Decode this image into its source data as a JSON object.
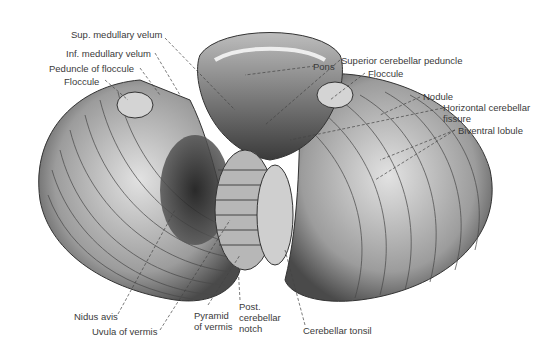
{
  "figure": {
    "colors": {
      "background": "#ffffff",
      "tissue_light": "#d9d9d9",
      "tissue_mid": "#9a9a9a",
      "tissue_dark": "#2a2a2a",
      "label_text": "#3a3a3a",
      "leader_line": "#444444"
    }
  },
  "labels": [
    {
      "id": "sup-medullary-velum",
      "text": "Sup. medullary velum"
    },
    {
      "id": "inf-medullary-velum",
      "text": "Inf. medullary velum"
    },
    {
      "id": "peduncle-of-floccule",
      "text": "Peduncle of floccule"
    },
    {
      "id": "floccule-left",
      "text": "Floccule"
    },
    {
      "id": "pons",
      "text": "Pons"
    },
    {
      "id": "superior-cerebellar-peduncle",
      "text": "Superior cerebellar peduncle"
    },
    {
      "id": "floccule-right",
      "text": "Floccule"
    },
    {
      "id": "nodule",
      "text": "Nodule"
    },
    {
      "id": "horizontal-cerebellar-fissure",
      "text": "Horizontal cerebellar\nfissure"
    },
    {
      "id": "biventral-lobule",
      "text": "Biventral lobule"
    },
    {
      "id": "nidus-avis",
      "text": "Nidus avis"
    },
    {
      "id": "uvula-of-vermis",
      "text": "Uvula of vermis"
    },
    {
      "id": "pyramid-of-vermis",
      "text": "Pyramid\nof vermis"
    },
    {
      "id": "post-cerebellar-notch",
      "text": "Post.\ncerebellar\nnotch"
    },
    {
      "id": "cerebellar-tonsil",
      "text": "Cerebellar tonsil"
    }
  ]
}
